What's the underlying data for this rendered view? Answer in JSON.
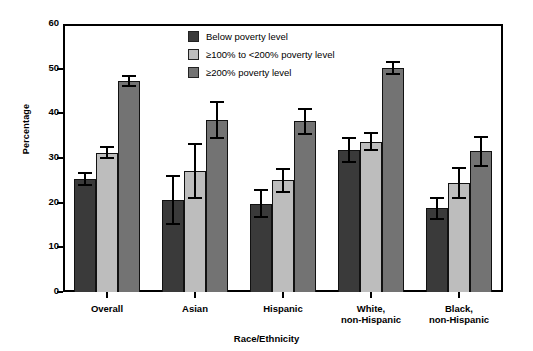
{
  "chart_data": {
    "type": "bar",
    "title": "",
    "xlabel": "Race/Ethnicity",
    "ylabel": "Percentage",
    "ylim": [
      0,
      60
    ],
    "yticks": [
      0,
      10,
      20,
      30,
      40,
      50,
      60
    ],
    "grid": false,
    "legend_position": "top-center",
    "categories": [
      "Overall",
      "Asian",
      "Hispanic",
      "White,\nnon-Hispanic",
      "Black,\nnon-Hispanic"
    ],
    "category_labels": [
      {
        "line1": "Overall",
        "line2": ""
      },
      {
        "line1": "Asian",
        "line2": ""
      },
      {
        "line1": "Hispanic",
        "line2": ""
      },
      {
        "line1": "White,",
        "line2": "non-Hispanic"
      },
      {
        "line1": "Black,",
        "line2": "non-Hispanic"
      }
    ],
    "series": [
      {
        "name": "Below poverty level",
        "color": "#3a3a3a",
        "values": [
          25.3,
          20.6,
          19.8,
          31.8,
          18.7
        ],
        "err_low": [
          1.3,
          5.4,
          3.0,
          2.6,
          2.4
        ],
        "err_high": [
          1.4,
          5.4,
          3.0,
          2.6,
          2.4
        ]
      },
      {
        "name": "≥100% to <200% poverty level",
        "color": "#bdbdbd",
        "values": [
          31.2,
          27.1,
          25.0,
          33.6,
          24.4
        ],
        "err_low": [
          1.2,
          6.0,
          2.6,
          1.9,
          3.3
        ],
        "err_high": [
          1.3,
          6.0,
          2.6,
          1.9,
          3.3
        ]
      },
      {
        "name": "≥200% poverty level",
        "color": "#737373",
        "values": [
          47.3,
          38.5,
          38.2,
          50.2,
          31.5
        ],
        "err_low": [
          1.1,
          4.0,
          2.8,
          1.3,
          3.2
        ],
        "err_high": [
          1.1,
          4.0,
          2.8,
          1.3,
          3.2
        ]
      }
    ]
  },
  "legend": {
    "items": [
      {
        "label": "Below poverty level",
        "color": "#3a3a3a"
      },
      {
        "label": "≥100% to <200% poverty level",
        "color": "#bdbdbd"
      },
      {
        "label": "≥200% poverty level",
        "color": "#737373"
      }
    ]
  }
}
